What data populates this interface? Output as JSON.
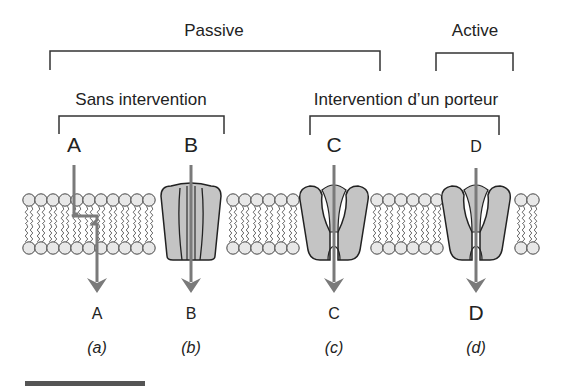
{
  "groups": {
    "passive": {
      "label": "Passive"
    },
    "active": {
      "label": "Active"
    },
    "no_carrier": {
      "label": "Sans intervention"
    },
    "carrier": {
      "label": "Intervention d’un porteur"
    }
  },
  "solutes": [
    {
      "id": "a",
      "top_label": "A",
      "bottom_label": "A",
      "caption": "(a)",
      "mechanism": "simple diffusion through bilayer"
    },
    {
      "id": "b",
      "top_label": "B",
      "bottom_label": "B",
      "caption": "(b)",
      "mechanism": "channel protein"
    },
    {
      "id": "c",
      "top_label": "C",
      "bottom_label": "C",
      "caption": "(c)",
      "mechanism": "carrier protein"
    },
    {
      "id": "d",
      "top_label": "D",
      "bottom_label": "D",
      "caption": "(d)",
      "mechanism": "carrier protein (active)"
    }
  ],
  "colors": {
    "line": "#333333",
    "arrow": "#7a7a7a",
    "protein_fill": "#c4c4c4",
    "head_fill": "#e8e8e8"
  }
}
